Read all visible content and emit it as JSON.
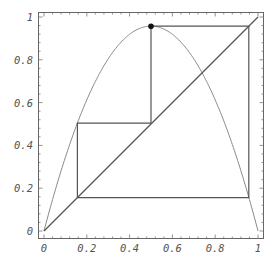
{
  "chart_data": {
    "type": "line",
    "title": "",
    "xlabel": "",
    "ylabel": "",
    "xlim": [
      0,
      1
    ],
    "ylim": [
      0,
      1
    ],
    "grid": false,
    "legend": null,
    "x_ticks": [
      "0",
      "0.2",
      "0.4",
      "0.6",
      "0.8",
      "1"
    ],
    "y_ticks": [
      "0",
      "0.2",
      "0.4",
      "0.6",
      "0.8",
      "1"
    ],
    "series": [
      {
        "name": "logistic map f(x) = r x (1 - x)",
        "kind": "curve",
        "r": 3.83,
        "peak": {
          "x": 0.5,
          "y": 0.957
        }
      },
      {
        "name": "diagonal y = x",
        "kind": "line",
        "points": [
          [
            0,
            0
          ],
          [
            1,
            1
          ]
        ]
      },
      {
        "name": "cobweb orbit (period 3)",
        "kind": "polyline",
        "points": [
          [
            0.5,
            0.957
          ],
          [
            0.957,
            0.957
          ],
          [
            0.957,
            0.156
          ],
          [
            0.156,
            0.156
          ],
          [
            0.156,
            0.504
          ],
          [
            0.5,
            0.504
          ],
          [
            0.5,
            0.957
          ]
        ]
      }
    ],
    "annotations": [
      {
        "type": "point",
        "x": 0.5,
        "y": 0.957,
        "label": ""
      }
    ]
  },
  "colors": {
    "background": "#ffffff",
    "frame": "#666666",
    "curve": "#8a8a8a",
    "path": "#555555",
    "text": "#555555"
  }
}
